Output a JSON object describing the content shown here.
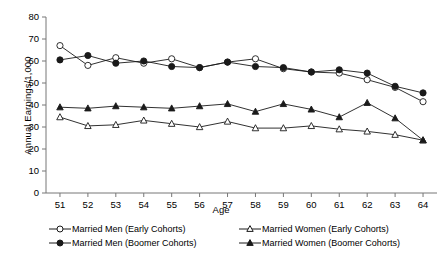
{
  "chart_data": {
    "type": "line",
    "title": "",
    "xlabel": "Age",
    "ylabel": "Annual Earnings/1,000",
    "x": [
      51,
      52,
      53,
      54,
      55,
      56,
      57,
      58,
      59,
      60,
      61,
      62,
      63,
      64
    ],
    "categories": [
      "51",
      "52",
      "53",
      "54",
      "55",
      "56",
      "57",
      "58",
      "59",
      "60",
      "61",
      "62",
      "63",
      "64"
    ],
    "xlim": [
      50.5,
      64.5
    ],
    "ylim": [
      0,
      80
    ],
    "yticks": [
      0,
      10,
      20,
      30,
      40,
      50,
      60,
      70,
      80
    ],
    "grid": false,
    "legend_position": "below",
    "series": [
      {
        "name": "Married Men (Early Cohorts)",
        "marker": "open-circle",
        "values": [
          67.0,
          58.0,
          61.5,
          59.0,
          61.0,
          57.0,
          59.5,
          61.0,
          56.5,
          55.0,
          54.5,
          51.5,
          48.0,
          41.5
        ]
      },
      {
        "name": "Married Men (Boomer Cohorts)",
        "marker": "filled-circle",
        "values": [
          60.5,
          62.5,
          59.0,
          60.0,
          57.5,
          57.0,
          59.5,
          57.5,
          57.0,
          55.0,
          56.0,
          54.5,
          48.5,
          45.5
        ]
      },
      {
        "name": "Married Women (Early Cohorts)",
        "marker": "open-triangle",
        "values": [
          34.5,
          30.5,
          31.0,
          33.0,
          31.5,
          30.0,
          32.5,
          29.5,
          29.5,
          30.5,
          29.0,
          28.0,
          26.5,
          24.0
        ]
      },
      {
        "name": "Married Women (Boomer Cohorts)",
        "marker": "filled-triangle",
        "values": [
          39.0,
          38.5,
          39.5,
          39.0,
          38.5,
          39.5,
          40.5,
          37.0,
          40.5,
          38.0,
          34.5,
          41.0,
          34.0,
          24.0
        ]
      }
    ]
  },
  "legend": {
    "entries": [
      {
        "label": "Married Men (Early Cohorts)",
        "marker": "open-circle"
      },
      {
        "label": "Married Men (Boomer Cohorts)",
        "marker": "filled-circle"
      },
      {
        "label": "Married Women (Early Cohorts)",
        "marker": "open-triangle"
      },
      {
        "label": "Married Women (Boomer Cohorts)",
        "marker": "filled-triangle"
      }
    ]
  },
  "colors": {
    "line": "#1a1a1a",
    "axis": "#777777",
    "text": "#000000",
    "background": "#ffffff"
  }
}
